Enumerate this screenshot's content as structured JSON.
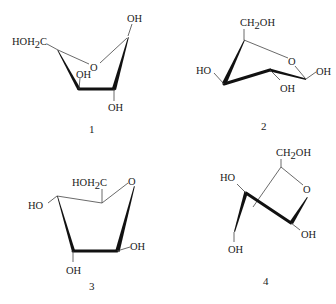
{
  "figure": {
    "structures": [
      {
        "id": "1",
        "label": "1",
        "substituents": {
          "top_right": "OH",
          "left": "HOH",
          "left_sub": "2",
          "left_tail": "C",
          "ring_oxygen": "O",
          "inner": "OH",
          "bottom": "OH"
        }
      },
      {
        "id": "2",
        "label": "2",
        "substituents": {
          "top": "CH",
          "top_sub": "2",
          "top_tail": "OH",
          "ring_oxygen": "O",
          "right": "OH",
          "left": "HO",
          "bottom": "OH"
        }
      },
      {
        "id": "3",
        "label": "3",
        "substituents": {
          "top": "HOH",
          "top_sub": "2",
          "top_tail": "C",
          "ring_oxygen": "O",
          "left": "HO",
          "right": "OH",
          "bottom": "OH"
        }
      },
      {
        "id": "4",
        "label": "4",
        "substituents": {
          "top": "CH",
          "top_sub": "2",
          "top_tail": "OH",
          "ring_oxygen": "O",
          "left": "HO",
          "bottom_left": "OH",
          "bottom_right": "OH"
        }
      }
    ]
  }
}
